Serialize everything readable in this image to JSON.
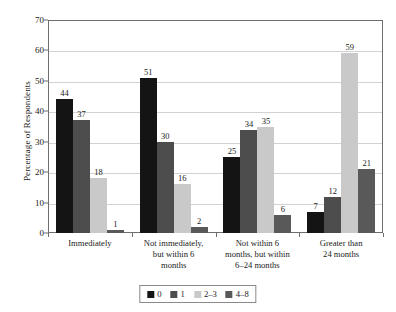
{
  "chart_data": {
    "type": "bar",
    "title": "",
    "xlabel": "",
    "ylabel": "Percentage of Respondents",
    "ylim": [
      0,
      70
    ],
    "yticks": [
      0,
      10,
      20,
      30,
      40,
      50,
      60,
      70
    ],
    "grid": true,
    "legend_position": "bottom",
    "categories": [
      "Immediately",
      "Not immediately, but within 6 months",
      "Not within 6 months, but within 6–24 months",
      "Greater than 24 months"
    ],
    "category_lines": [
      [
        "Immediately"
      ],
      [
        "Not immediately,",
        "but within 6",
        "months"
      ],
      [
        "Not within 6",
        "months, but within",
        "6–24 months"
      ],
      [
        "Greater than",
        "24 months"
      ]
    ],
    "series": [
      {
        "name": "0",
        "color": "#141414",
        "values": [
          44,
          51,
          25,
          7
        ]
      },
      {
        "name": "1",
        "color": "#4d4d4d",
        "values": [
          37,
          30,
          34,
          12
        ]
      },
      {
        "name": "2–3",
        "color": "#c9c9c9",
        "values": [
          18,
          16,
          35,
          59
        ]
      },
      {
        "name": "4–8",
        "color": "#595959",
        "values": [
          1,
          2,
          6,
          21
        ]
      }
    ]
  },
  "axis": {
    "y_title": "Percentage of Respondents"
  }
}
